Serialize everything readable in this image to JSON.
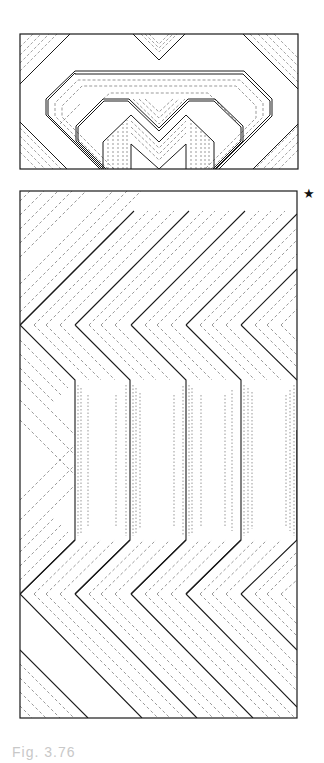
{
  "figure": {
    "caption": "Fig. 3.76",
    "marker": "★",
    "top_panel": {
      "description": "Rectangular panel with nested octagonal outlines and an M-shaped chevron motif, solid and dashed contour lines"
    },
    "bottom_panel": {
      "description": "Tall rectangular panel with five columns of zigzag chevron contour lines, solid lines flanked by dashed/dotted parallels, diagonal hatching at top and bottom"
    },
    "colors": {
      "line": "#1a1a1a",
      "dash": "#555555",
      "background": "#ffffff"
    }
  }
}
